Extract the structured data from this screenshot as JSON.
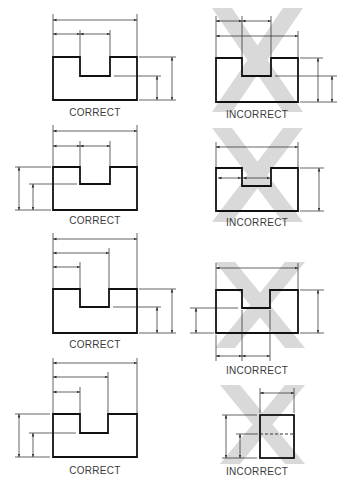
{
  "figure": {
    "colors": {
      "line": "#1a1a1a",
      "thin": "#2a2a2a",
      "cross": "#d6d6d6",
      "label": "#3a3a3a"
    }
  },
  "panels": [
    {
      "id": 1,
      "column": "left",
      "row": 1,
      "label": "CORRECT",
      "verdict": "correct"
    },
    {
      "id": 2,
      "column": "right",
      "row": 1,
      "label": "INCORRECT",
      "verdict": "incorrect"
    },
    {
      "id": 3,
      "column": "left",
      "row": 2,
      "label": "CORRECT",
      "verdict": "correct"
    },
    {
      "id": 4,
      "column": "right",
      "row": 2,
      "label": "INCORRECT",
      "verdict": "incorrect"
    },
    {
      "id": 5,
      "column": "left",
      "row": 3,
      "label": "CORRECT",
      "verdict": "correct"
    },
    {
      "id": 6,
      "column": "right",
      "row": 3,
      "label": "INCORRECT",
      "verdict": "incorrect"
    },
    {
      "id": 7,
      "column": "left",
      "row": 4,
      "label": "CORRECT",
      "verdict": "correct"
    },
    {
      "id": 8,
      "column": "right",
      "row": 4,
      "label": "INCORRECT",
      "verdict": "incorrect"
    }
  ]
}
